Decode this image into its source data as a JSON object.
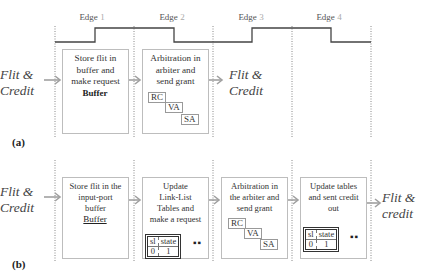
{
  "clock": {
    "edges": [
      {
        "label": "Edge",
        "num": "1"
      },
      {
        "label": "Edge",
        "num": "2"
      },
      {
        "label": "Edge",
        "num": "3"
      },
      {
        "label": "Edge",
        "num": "4"
      }
    ]
  },
  "panel_a": {
    "label": "(a)",
    "input_label_line1": "Flit &",
    "input_label_line2": "Credit",
    "output_label_line1": "Flit &",
    "output_label_line2": "Credit",
    "stages": [
      {
        "text": [
          "Store flit in",
          "buffer and",
          "make request"
        ],
        "buffer_title": "Buffer"
      },
      {
        "text": [
          "Arbitration in",
          "arbiter and",
          "send grant"
        ],
        "pipeline": [
          "RC",
          "VA",
          "SA"
        ]
      }
    ]
  },
  "panel_b": {
    "label": "(b)",
    "input_label_line1": "Flit &",
    "input_label_line2": "Credit",
    "output_label_line1": "Flit &",
    "output_label_line2": "credit",
    "stages": [
      {
        "text": [
          "Store flit in the",
          "input-port",
          "buffer"
        ],
        "buffer_title": "Buffer"
      },
      {
        "text": [
          "Update",
          "Link-List",
          "Tables and",
          "make a request"
        ],
        "table": {
          "headers": [
            "sl",
            "state"
          ],
          "row": [
            "0",
            "1"
          ]
        },
        "more": "▪▪"
      },
      {
        "text": [
          "Arbitration in",
          "the arbiter and",
          "send grant"
        ],
        "pipeline": [
          "RC",
          "VA",
          "SA"
        ]
      },
      {
        "text": [
          "Update tables",
          "and sent credit",
          "out"
        ],
        "table": {
          "headers": [
            "sl",
            "state"
          ],
          "row": [
            "0",
            "1"
          ]
        },
        "more": "▪▪"
      }
    ]
  },
  "colors": {
    "arrow": "#a0a0a0",
    "clock": "#444444",
    "dotted": "#888888",
    "box_border": "#bdbdbd"
  }
}
